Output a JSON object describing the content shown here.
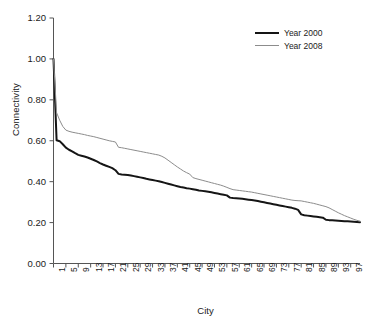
{
  "chart_data": {
    "type": "line",
    "title": "",
    "xlabel": "City",
    "ylabel": "Connectivity",
    "xlim": [
      1,
      100
    ],
    "ylim": [
      0.0,
      1.2
    ],
    "grid": false,
    "legend_position": "top-right",
    "ytick_labels": [
      "1.20",
      "1.00",
      "0.80",
      "0.60",
      "0.40",
      "0.20",
      "0.00"
    ],
    "ytick_values": [
      1.2,
      1.0,
      0.8,
      0.6,
      0.4,
      0.2,
      0.0
    ],
    "xtick_labels": [
      "1",
      "5",
      "9",
      "13",
      "17",
      "21",
      "25",
      "29",
      "33",
      "37",
      "41",
      "45",
      "49",
      "53",
      "57",
      "61",
      "65",
      "69",
      "73",
      "77",
      "81",
      "85",
      "89",
      "93",
      "97"
    ],
    "xtick_values": [
      1,
      5,
      9,
      13,
      17,
      21,
      25,
      29,
      33,
      37,
      41,
      45,
      49,
      53,
      57,
      61,
      65,
      69,
      73,
      77,
      81,
      85,
      89,
      93,
      97
    ],
    "x": [
      1,
      2,
      3,
      4,
      5,
      6,
      7,
      8,
      9,
      10,
      11,
      12,
      13,
      14,
      15,
      16,
      17,
      18,
      19,
      20,
      21,
      22,
      23,
      24,
      25,
      26,
      27,
      28,
      29,
      30,
      31,
      32,
      33,
      34,
      35,
      36,
      37,
      38,
      39,
      40,
      41,
      42,
      43,
      44,
      45,
      46,
      47,
      48,
      49,
      50,
      51,
      52,
      53,
      54,
      55,
      56,
      57,
      58,
      59,
      60,
      61,
      62,
      63,
      64,
      65,
      66,
      67,
      68,
      69,
      70,
      71,
      72,
      73,
      74,
      75,
      76,
      77,
      78,
      79,
      80,
      81,
      82,
      83,
      84,
      85,
      86,
      87,
      88,
      89,
      90,
      91,
      92,
      93,
      94,
      95,
      96,
      97,
      98,
      99,
      100
    ],
    "series": [
      {
        "name": "Year 2000",
        "color": "#151515",
        "width": 2.0,
        "values": [
          1.0,
          0.602,
          0.598,
          0.583,
          0.566,
          0.556,
          0.548,
          0.539,
          0.531,
          0.527,
          0.523,
          0.518,
          0.512,
          0.506,
          0.499,
          0.491,
          0.484,
          0.478,
          0.472,
          0.466,
          0.456,
          0.438,
          0.435,
          0.434,
          0.433,
          0.43,
          0.427,
          0.424,
          0.421,
          0.418,
          0.414,
          0.411,
          0.408,
          0.405,
          0.402,
          0.398,
          0.394,
          0.39,
          0.386,
          0.382,
          0.378,
          0.374,
          0.371,
          0.368,
          0.366,
          0.363,
          0.36,
          0.357,
          0.355,
          0.353,
          0.351,
          0.348,
          0.345,
          0.342,
          0.339,
          0.336,
          0.333,
          0.322,
          0.32,
          0.319,
          0.318,
          0.316,
          0.314,
          0.312,
          0.31,
          0.308,
          0.305,
          0.302,
          0.299,
          0.296,
          0.293,
          0.29,
          0.287,
          0.284,
          0.281,
          0.278,
          0.275,
          0.272,
          0.268,
          0.262,
          0.24,
          0.236,
          0.234,
          0.232,
          0.23,
          0.228,
          0.226,
          0.224,
          0.214,
          0.212,
          0.211,
          0.21,
          0.209,
          0.208,
          0.207,
          0.206,
          0.205,
          0.204,
          0.203,
          0.202
        ]
      },
      {
        "name": "Year 2008",
        "color": "#8c8c8c",
        "width": 1.0,
        "values": [
          1.0,
          0.737,
          0.7,
          0.67,
          0.652,
          0.646,
          0.642,
          0.639,
          0.636,
          0.633,
          0.63,
          0.626,
          0.623,
          0.62,
          0.616,
          0.612,
          0.608,
          0.604,
          0.6,
          0.597,
          0.594,
          0.568,
          0.566,
          0.563,
          0.56,
          0.557,
          0.554,
          0.551,
          0.548,
          0.545,
          0.542,
          0.539,
          0.536,
          0.533,
          0.53,
          0.524,
          0.516,
          0.505,
          0.494,
          0.483,
          0.472,
          0.462,
          0.452,
          0.444,
          0.437,
          0.42,
          0.415,
          0.411,
          0.407,
          0.403,
          0.399,
          0.395,
          0.391,
          0.387,
          0.383,
          0.378,
          0.372,
          0.366,
          0.361,
          0.359,
          0.357,
          0.355,
          0.353,
          0.351,
          0.349,
          0.346,
          0.343,
          0.34,
          0.337,
          0.334,
          0.331,
          0.328,
          0.325,
          0.322,
          0.319,
          0.316,
          0.313,
          0.31,
          0.308,
          0.307,
          0.306,
          0.303,
          0.3,
          0.297,
          0.294,
          0.29,
          0.286,
          0.282,
          0.278,
          0.272,
          0.264,
          0.256,
          0.248,
          0.241,
          0.234,
          0.228,
          0.222,
          0.216,
          0.211,
          0.207
        ]
      }
    ]
  },
  "axes": {
    "ylabel": "Connectivity",
    "xlabel": "City"
  },
  "legend": {
    "items": [
      {
        "label": "Year 2000"
      },
      {
        "label": "Year 2008"
      }
    ]
  }
}
